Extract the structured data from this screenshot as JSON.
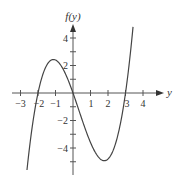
{
  "chart_data": {
    "type": "line",
    "title": "",
    "xlabel": "y",
    "ylabel": "f(y)",
    "function": "f(y) = 0.6*(y+2)*y*(y-3)",
    "roots": [
      -2,
      0,
      3
    ],
    "local_max": {
      "x": -1,
      "y": 2.5
    },
    "local_min": {
      "x": 1.8,
      "y": -4.9
    },
    "x_ticks": [
      -3,
      -2,
      -1,
      0,
      1,
      2,
      3,
      4
    ],
    "x_tick_labels": [
      "-3",
      "-2",
      "-1",
      "1",
      "2",
      "3",
      "4"
    ],
    "y_ticks": [
      -5,
      -4,
      -3,
      -2,
      -1,
      1,
      2,
      3,
      4
    ],
    "y_tick_labels": [
      "4",
      "2",
      "-2",
      "-4"
    ],
    "xlim": [
      -3.5,
      4.5
    ],
    "ylim": [
      -5.8,
      5
    ],
    "grid": false,
    "series": [
      {
        "name": "f(y)",
        "x": [
          -2.63,
          -2.5,
          -2.25,
          -2,
          -1.75,
          -1.5,
          -1.25,
          -1,
          -0.75,
          -0.5,
          -0.25,
          0,
          0.25,
          0.5,
          0.75,
          1,
          1.25,
          1.5,
          1.8,
          2,
          2.25,
          2.5,
          2.75,
          3,
          3.25,
          3.43
        ],
        "values": [
          -5.6,
          -4.13,
          -1.59,
          0,
          1.1,
          1.76,
          2.25,
          2.4,
          2.39,
          2.1,
          1.61,
          0,
          -1.01,
          -1.88,
          -2.53,
          -3.6,
          -4.27,
          -4.72,
          -4.92,
          -4.8,
          -4.56,
          -4.13,
          -2.83,
          0,
          2.54,
          4.8
        ]
      }
    ]
  },
  "labels": {
    "x_axis": "y",
    "y_axis": "f(y)",
    "x_neg3": "−3",
    "x_neg2": "−2",
    "x_neg1": "−1",
    "x_1": "1",
    "x_2": "2",
    "x_3": "3",
    "x_4": "4",
    "y_4": "4",
    "y_2": "2",
    "y_neg2": "−2",
    "y_neg4": "−4"
  }
}
